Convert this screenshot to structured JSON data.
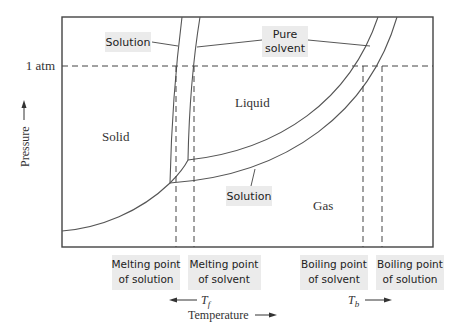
{
  "diagram": {
    "type": "phase-diagram",
    "title": "",
    "axes": {
      "x_label": "Temperature",
      "y_label": "Pressure"
    },
    "reference_line": {
      "label": "1 atm"
    },
    "regions": {
      "solid": "Solid",
      "liquid": "Liquid",
      "gas": "Gas"
    },
    "curve_labels": {
      "solution_top": "Solution",
      "pure_solvent_line1": "Pure",
      "pure_solvent_line2": "solvent",
      "solution_bottom": "Solution"
    },
    "bottom_labels": [
      {
        "line1": "Melting point",
        "line2": "of solution"
      },
      {
        "line1": "Melting point",
        "line2": "of solvent"
      },
      {
        "line1": "Boiling point",
        "line2": "of solvent"
      },
      {
        "line1": "Boiling point",
        "line2": "of solution"
      }
    ],
    "delta_labels": {
      "tf_main": "T",
      "tf_sub": "f",
      "tb_main": "T",
      "tb_sub": "b"
    },
    "colors": {
      "line": "#555555",
      "frame": "#444444",
      "label_box": "#ebebeb",
      "text": "#333333"
    }
  }
}
